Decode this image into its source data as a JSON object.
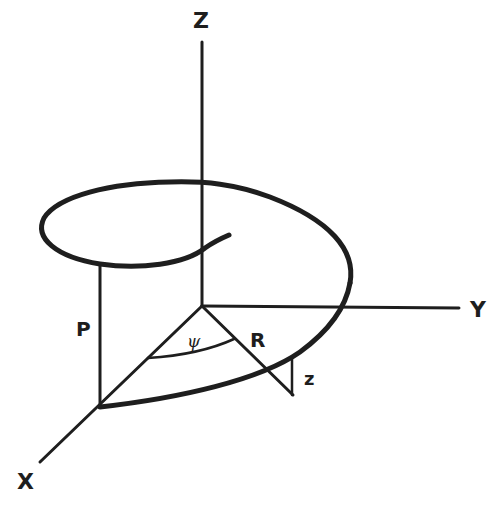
{
  "diagram": {
    "colors": {
      "ink": "#1e1e1e",
      "background": "#ffffff"
    },
    "axes": {
      "z": {
        "label": "Z"
      },
      "y": {
        "label": "Y"
      },
      "x": {
        "label": "X"
      }
    },
    "annotations": {
      "pitch": "P",
      "radius": "R",
      "angle": "ψ",
      "height": "z"
    }
  }
}
